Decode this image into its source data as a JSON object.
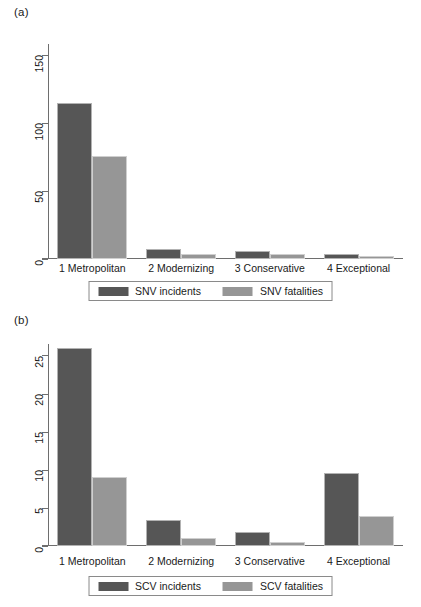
{
  "figure": {
    "panel_a_label": "(a)",
    "panel_b_label": "(b)"
  },
  "chart_data": [
    {
      "panel": "(a)",
      "type": "bar",
      "title": "",
      "xlabel": "",
      "ylabel": "",
      "categories": [
        "1 Metropolitan",
        "2 Modernizing",
        "3 Conservative",
        "4 Exceptional"
      ],
      "series": [
        {
          "name": "SNV incidents",
          "color": "#565656",
          "values": [
            115,
            7.3,
            6,
            4
          ]
        },
        {
          "name": "SNV fatalities",
          "color": "#969696",
          "values": [
            76,
            3.6,
            3.4,
            2.4
          ]
        }
      ],
      "yticks": [
        0,
        50,
        100,
        150
      ],
      "ylim": [
        0,
        158
      ],
      "grid": false,
      "legend_position": "bottom"
    },
    {
      "panel": "(b)",
      "type": "bar",
      "title": "",
      "xlabel": "",
      "ylabel": "",
      "categories": [
        "1 Metropolitan",
        "2 Modernizing",
        "3 Conservative",
        "4 Exceptional"
      ],
      "series": [
        {
          "name": "SCV incidents",
          "color": "#565656",
          "values": [
            26,
            3.4,
            1.8,
            9.6
          ]
        },
        {
          "name": "SCV fatalities",
          "color": "#969696",
          "values": [
            9,
            1.1,
            0.5,
            3.9
          ]
        }
      ],
      "yticks": [
        0,
        5,
        10,
        15,
        20,
        25
      ],
      "ylim": [
        0,
        26.5
      ],
      "grid": false,
      "legend_position": "bottom"
    }
  ]
}
